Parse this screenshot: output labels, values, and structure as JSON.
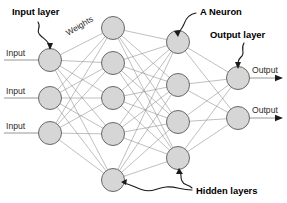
{
  "figure": {
    "width": 287,
    "height": 203,
    "background": "#ffffff"
  },
  "chart_data": {
    "type": "diagram",
    "subtype": "feedforward-neural-network",
    "layers": [
      {
        "name": "Input layer",
        "role": "input",
        "node_count": 3,
        "x": 50,
        "node_y": [
          60,
          98,
          133
        ]
      },
      {
        "name": "Hidden layer 1",
        "role": "hidden",
        "node_count": 5,
        "x": 113,
        "node_y": [
          28,
          63,
          98,
          134,
          180
        ]
      },
      {
        "name": "Hidden layer 2",
        "role": "hidden",
        "node_count": 4,
        "x": 178,
        "node_y": [
          42,
          85,
          122,
          158
        ]
      },
      {
        "name": "Output layer",
        "role": "output",
        "node_count": 2,
        "x": 238,
        "node_y": [
          78,
          118
        ]
      }
    ],
    "node_radius": 11.5,
    "fully_connected": true,
    "edge_count": 15,
    "node_fill": "#d6d6d6",
    "node_stroke": "#5a5a5a",
    "edge_color": "#8a8a8a"
  },
  "inputs": [
    {
      "label": "Input",
      "y": 60
    },
    {
      "label": "Input",
      "y": 98
    },
    {
      "label": "Input",
      "y": 133
    }
  ],
  "outputs": [
    {
      "label": "Output",
      "y": 78
    },
    {
      "label": "Output",
      "y": 118
    }
  ],
  "annotations": {
    "input_layer": {
      "label": "Input layer",
      "x": 12,
      "y": 15
    },
    "weights": {
      "label": "Weights",
      "x": 68,
      "y": 36,
      "rotation": -31
    },
    "a_neuron": {
      "label": "A Neuron",
      "x": 200,
      "y": 15
    },
    "output_layer": {
      "label": "Output layer",
      "x": 210,
      "y": 38
    },
    "hidden_layers": {
      "label": "Hidden layers",
      "x": 196,
      "y": 194
    }
  },
  "colors": {
    "ink": "#000000",
    "node_fill": "#d6d6d6",
    "node_stroke": "#5a5a5a",
    "edge": "#8a8a8a",
    "text": "#2b2b2b"
  }
}
